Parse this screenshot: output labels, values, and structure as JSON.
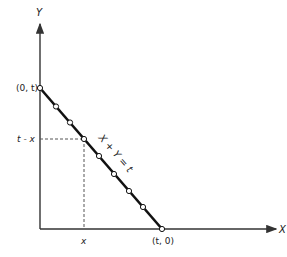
{
  "diagram": {
    "axes": {
      "x_label": "X",
      "y_label": "Y"
    },
    "points": {
      "y_intercept_label": "(0, t)",
      "x_intercept_label": "(t, 0)"
    },
    "line_label": "X + Y = t",
    "guide": {
      "x_tick_label": "x",
      "y_tick_label": "t - x"
    },
    "colors": {
      "line": "#111111",
      "axis": "#333333",
      "dashed": "#555555",
      "marker_fill": "#ffffff"
    }
  }
}
